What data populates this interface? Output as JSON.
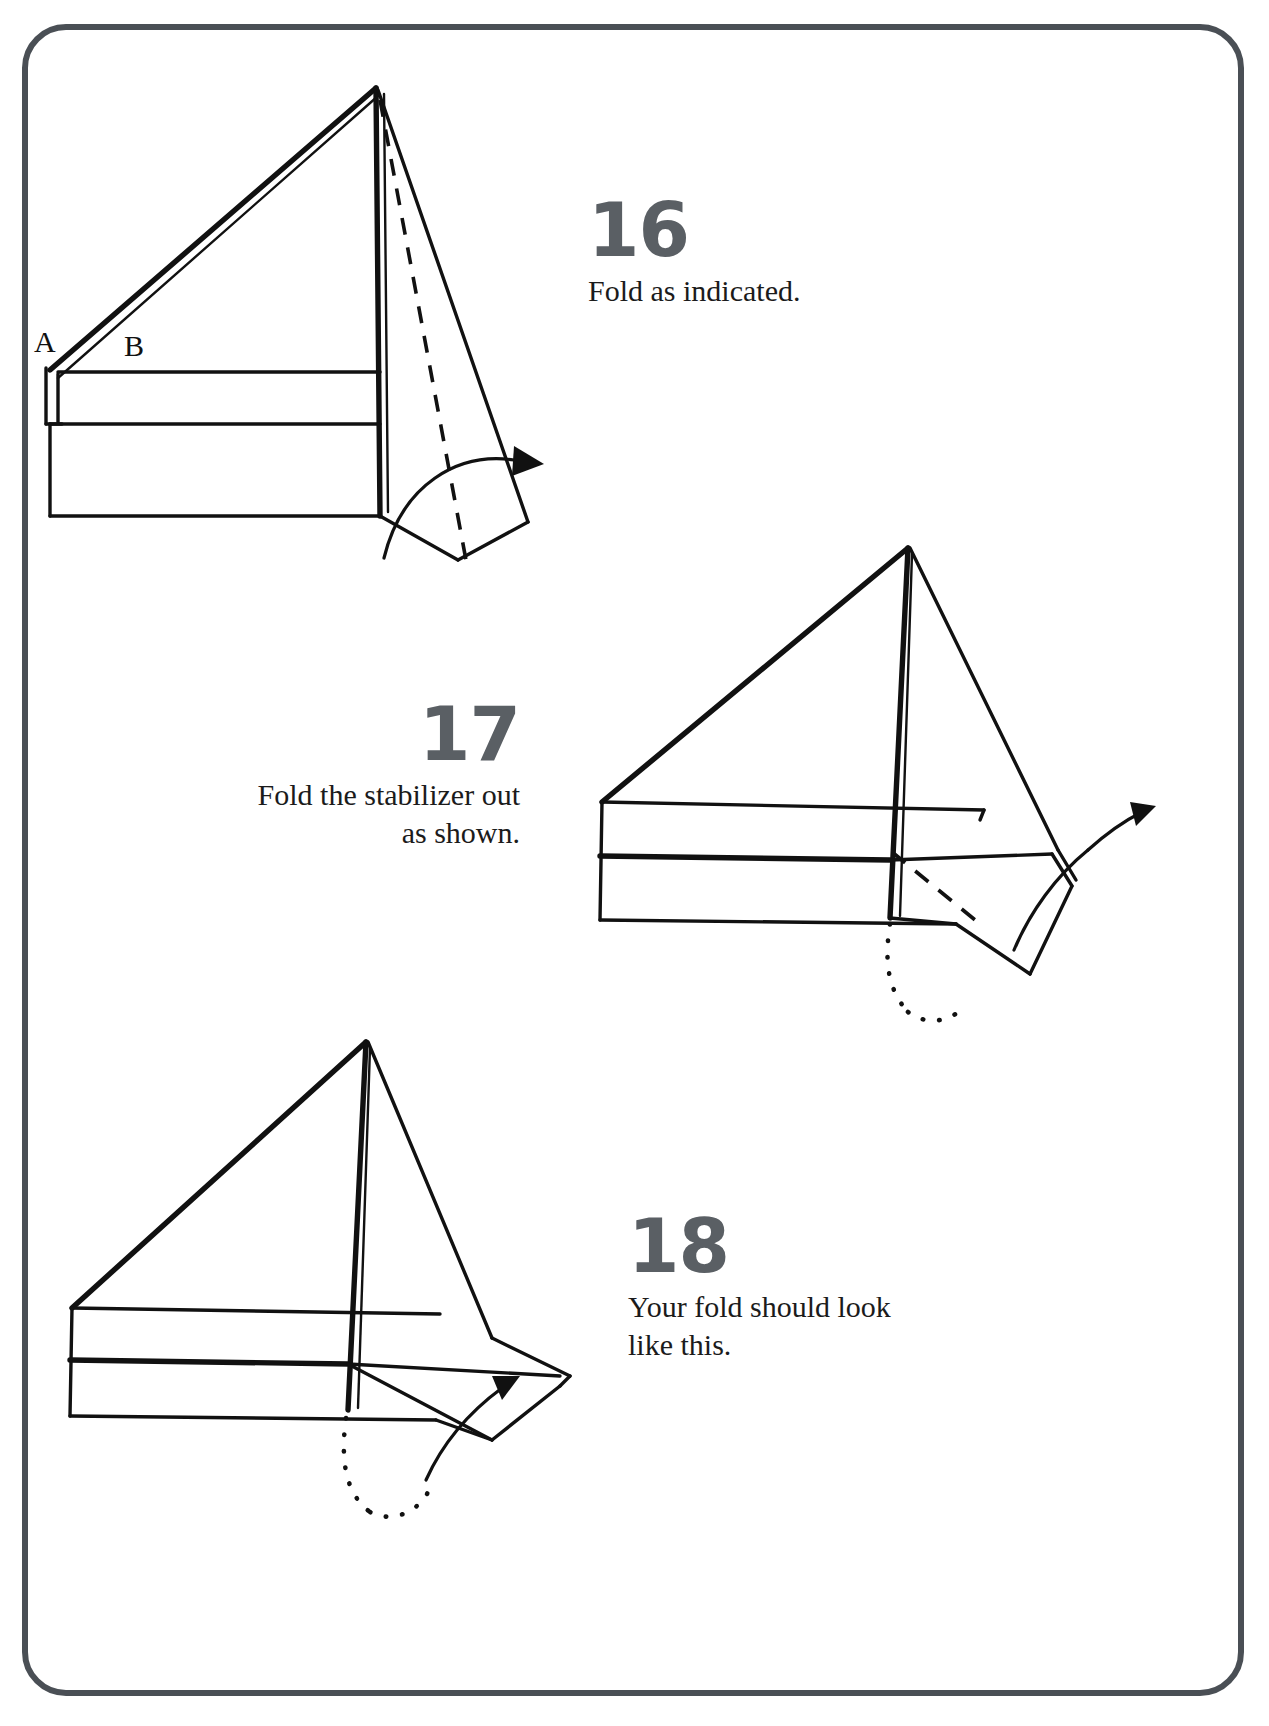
{
  "page": {
    "frame_color": "#4a4f55",
    "background": "#ffffff",
    "ink_color": "#111111",
    "number_color": "#5a5f64"
  },
  "steps": [
    {
      "number": "16",
      "caption": "Fold as indicated.",
      "align": "left",
      "figure": "paper-airplane-step-16",
      "figure_labels": [
        {
          "text": "A",
          "name": "fold-label-a"
        },
        {
          "text": "B",
          "name": "fold-label-b"
        }
      ],
      "annotations": {
        "dashed_line": "valley fold line on tail",
        "arrow": "curved arrow folding tail flap to the right"
      }
    },
    {
      "number": "17",
      "caption": "Fold the stabilizer out\nas shown.",
      "align": "right",
      "figure": "paper-airplane-step-17",
      "figure_labels": [],
      "annotations": {
        "dashed_line": "valley fold line on stabilizer",
        "dotted_line": "hidden edge behind body",
        "arrow": "curved arrow folding stabilizer outward and up"
      }
    },
    {
      "number": "18",
      "caption": "Your fold should look\nlike this.",
      "align": "left",
      "figure": "paper-airplane-step-18",
      "figure_labels": [],
      "annotations": {
        "dotted_line": "hidden edge behind body",
        "arrow": "curved arrow indicating completed stabilizer fold"
      }
    }
  ]
}
